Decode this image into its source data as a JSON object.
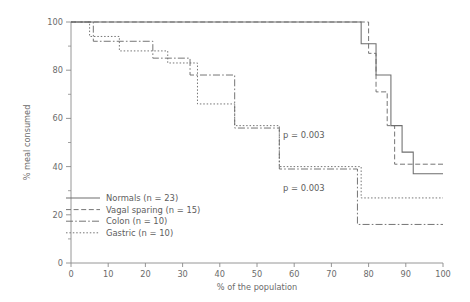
{
  "chart_data": {
    "type": "line",
    "title": "",
    "subtitle": "",
    "xlabel": "% of the population",
    "ylabel": "% meal consumed",
    "xlim": [
      0,
      100
    ],
    "ylim": [
      0,
      100
    ],
    "x_ticks": [
      0,
      10,
      20,
      30,
      40,
      50,
      60,
      70,
      80,
      90,
      100
    ],
    "x_tick_labels": [
      "0",
      "10",
      "20",
      "30",
      "40",
      "50",
      "60",
      "70",
      "80",
      "90",
      "100"
    ],
    "y_ticks": [
      0,
      20,
      40,
      60,
      80,
      100
    ],
    "y_tick_labels": [
      "0",
      "20",
      "40",
      "60",
      "80",
      "100"
    ],
    "y_minor_ticks": [
      10,
      30,
      50,
      70,
      90
    ],
    "grid": false,
    "legend_position": "lower-left",
    "line_color": "#6e6e6e",
    "axis_color": "#8a8a8a",
    "text_color": "#5d5d5d",
    "step_type": "post",
    "series": [
      {
        "name": "Normals (n = 23)",
        "label": "Normals (n = 23)",
        "dash": "solid",
        "n": 23,
        "points": [
          [
            0,
            100
          ],
          [
            78,
            100
          ],
          [
            78,
            91
          ],
          [
            82,
            91
          ],
          [
            82,
            78
          ],
          [
            86,
            78
          ],
          [
            86,
            57
          ],
          [
            89,
            57
          ],
          [
            89,
            46
          ],
          [
            92,
            46
          ],
          [
            92,
            37
          ],
          [
            100,
            37
          ]
        ]
      },
      {
        "name": "Vagal sparing (n = 15)",
        "label": "Vagal sparing (n = 15)",
        "dash": "dashed",
        "n": 15,
        "points": [
          [
            0,
            100
          ],
          [
            80,
            100
          ],
          [
            80,
            87
          ],
          [
            82,
            87
          ],
          [
            82,
            71
          ],
          [
            85,
            71
          ],
          [
            85,
            57
          ],
          [
            87,
            57
          ],
          [
            87,
            41
          ],
          [
            100,
            41
          ]
        ]
      },
      {
        "name": "Colon (n = 10)",
        "label": "Colon (n = 10)",
        "dash": "dashdot",
        "n": 10,
        "points": [
          [
            0,
            100
          ],
          [
            6,
            100
          ],
          [
            6,
            92
          ],
          [
            22,
            92
          ],
          [
            22,
            85
          ],
          [
            32,
            85
          ],
          [
            32,
            78
          ],
          [
            44,
            78
          ],
          [
            44,
            56
          ],
          [
            56,
            56
          ],
          [
            56,
            39
          ],
          [
            77,
            39
          ],
          [
            77,
            16
          ],
          [
            100,
            16
          ]
        ]
      },
      {
        "name": "Gastric (n = 10)",
        "label": "Gastric (n = 10)",
        "dash": "dotted",
        "n": 10,
        "points": [
          [
            0,
            100
          ],
          [
            5,
            100
          ],
          [
            5,
            94
          ],
          [
            13,
            94
          ],
          [
            13,
            88
          ],
          [
            26,
            88
          ],
          [
            26,
            83
          ],
          [
            34,
            83
          ],
          [
            34,
            66
          ],
          [
            44,
            66
          ],
          [
            44,
            57
          ],
          [
            56,
            57
          ],
          [
            56,
            40
          ],
          [
            78,
            40
          ],
          [
            78,
            27
          ],
          [
            100,
            27
          ]
        ]
      }
    ],
    "annotations": [
      {
        "text": "p = 0.003",
        "x": 57,
        "y": 52
      },
      {
        "text": "p = 0.003",
        "x": 57,
        "y": 30
      }
    ]
  },
  "legend": {
    "items": [
      {
        "label": "Normals (n = 23)",
        "dash": "solid"
      },
      {
        "label": "Vagal sparing (n = 15)",
        "dash": "dashed"
      },
      {
        "label": "Colon (n = 10)",
        "dash": "dashdot"
      },
      {
        "label": "Gastric (n = 10)",
        "dash": "dotted"
      }
    ]
  }
}
